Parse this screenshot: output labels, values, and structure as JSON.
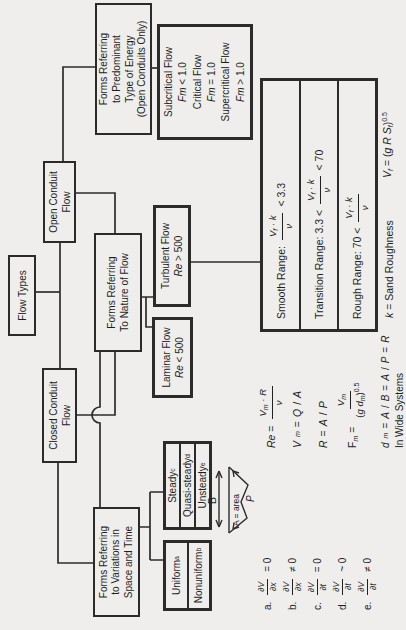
{
  "colors": {
    "background": "#efeeec",
    "ink": "#222222",
    "line": "#2c2c2c"
  },
  "boxes": {
    "flow_types": {
      "label": "Flow Types"
    },
    "closed": {
      "lines": [
        "Closed Conduit",
        "Flow"
      ]
    },
    "open": {
      "lines": [
        "Open Conduit",
        "Flow"
      ]
    },
    "forms_pred": {
      "lines": [
        "Forms Referring",
        "to Predominant",
        "Type of Energy",
        "(Open Conduits Only)"
      ]
    },
    "forms_nature": {
      "lines": [
        "Forms Referring",
        "To Nature of Flow"
      ]
    },
    "forms_var": {
      "lines": [
        "Forms Referring",
        "to Variations in",
        "Space and Time"
      ]
    },
    "subcritical": {
      "lines": [
        [
          {
            "t": "Subcritical Flow"
          }
        ],
        [
          {
            "i": "Fm"
          },
          {
            "t": " < 1.0"
          }
        ],
        [
          {
            "t": "Critical Flow"
          }
        ],
        [
          {
            "i": "Fm"
          },
          {
            "t": " = 1.0"
          }
        ],
        [
          {
            "t": "Supercritical Flow"
          }
        ],
        [
          {
            "i": "Fm"
          },
          {
            "t": " > 1.0"
          }
        ]
      ]
    },
    "laminar": {
      "line1": "Laminar Flow",
      "line2": [
        {
          "i": "Re"
        },
        {
          "t": " < 500"
        }
      ]
    },
    "turbulent": {
      "line1": "Turbulent Flow",
      "line2": [
        {
          "i": "Re"
        },
        {
          "t": " > 500"
        }
      ]
    },
    "steady": {
      "rows": [
        [
          {
            "t": "Steady"
          },
          {
            "u": "c"
          }
        ],
        [
          {
            "t": "Quasi-steady"
          },
          {
            "u": "d"
          }
        ],
        [
          {
            "t": "Unsteady"
          },
          {
            "u": "e"
          }
        ]
      ]
    },
    "uniform": {
      "rows": [
        [
          {
            "t": "Uniform"
          },
          {
            "u": "a"
          }
        ],
        [
          {
            "t": "Nonuniform"
          },
          {
            "u": "b"
          }
        ]
      ]
    },
    "range_table": {
      "rows": [
        {
          "pre": [
            {
              "t": "Smooth Range:"
            }
          ],
          "num": [
            {
              "i": "V"
            },
            {
              "s": "f"
            },
            {
              "t": " · "
            },
            {
              "i": "k"
            }
          ],
          "den": [
            {
              "i": "ν"
            }
          ],
          "post": [
            {
              "t": "< 3.3"
            }
          ]
        },
        {
          "pre": [
            {
              "t": "Transition Range: 3.3 <"
            }
          ],
          "num": [
            {
              "i": "V"
            },
            {
              "s": "f"
            },
            {
              "t": " · "
            },
            {
              "i": "k"
            }
          ],
          "den": [
            {
              "i": "ν"
            }
          ],
          "post": [
            {
              "t": "< 70"
            }
          ]
        },
        {
          "pre": [
            {
              "t": "Rough Range: 70 <"
            }
          ],
          "num": [
            {
              "i": "V"
            },
            {
              "s": "f"
            },
            {
              "t": " · "
            },
            {
              "i": "k"
            }
          ],
          "den": [
            {
              "i": "ν"
            }
          ],
          "post": [
            {
              "t": ""
            }
          ]
        }
      ]
    }
  },
  "formulas": {
    "re": {
      "lhs": [
        {
          "i": "Re"
        },
        {
          "t": " ="
        }
      ],
      "num": [
        {
          "i": "V"
        },
        {
          "s": "m"
        },
        {
          "t": " · "
        },
        {
          "i": "R"
        }
      ],
      "den": [
        {
          "i": "ν"
        }
      ]
    },
    "vm": {
      "line": [
        {
          "i": "V"
        },
        {
          "s": "m"
        },
        {
          "t": " = "
        },
        {
          "i": "Q"
        },
        {
          "t": "/"
        },
        {
          "i": "A"
        }
      ]
    },
    "r": {
      "line": [
        {
          "i": "R"
        },
        {
          "t": " = "
        },
        {
          "i": "A"
        },
        {
          "t": "/"
        },
        {
          "i": "P"
        }
      ]
    },
    "fm": {
      "lhs": [
        {
          "t": "F"
        },
        {
          "s": "m"
        },
        {
          "t": " ="
        }
      ],
      "num": [
        {
          "i": "V"
        },
        {
          "s": "m"
        }
      ],
      "den": [
        {
          "t": "("
        },
        {
          "i": "g d"
        },
        {
          "s": "m"
        },
        {
          "t": ")"
        },
        {
          "u": "0.5"
        }
      ]
    },
    "dm": {
      "line": [
        {
          "i": "d"
        },
        {
          "s": "m"
        },
        {
          "t": " = "
        },
        {
          "i": "A"
        },
        {
          "t": "/"
        },
        {
          "i": "B"
        },
        {
          "t": " = "
        },
        {
          "i": "A"
        },
        {
          "t": "/"
        },
        {
          "i": "P"
        },
        {
          "t": " = "
        },
        {
          "i": "R"
        }
      ],
      "note": "In Wide Systems"
    },
    "k_sand": [
      {
        "i": "k"
      },
      {
        "t": " = Sand Roughness"
      }
    ],
    "vf": [
      {
        "i": "V"
      },
      {
        "s": "f"
      },
      {
        "t": " = ("
      },
      {
        "i": "g R S"
      },
      {
        "s": "f"
      },
      {
        "t": ")"
      },
      {
        "u": "0.5"
      }
    ]
  },
  "footnotes": [
    {
      "label": "a.",
      "num": [
        {
          "t": "∂"
        },
        {
          "i": "V"
        }
      ],
      "den": [
        {
          "t": "∂"
        },
        {
          "i": "x"
        }
      ],
      "tail": "= 0"
    },
    {
      "label": "b.",
      "num": [
        {
          "t": "∂"
        },
        {
          "i": "V"
        }
      ],
      "den": [
        {
          "t": "∂"
        },
        {
          "i": "x"
        }
      ],
      "tail": "≠ 0"
    },
    {
      "label": "c.",
      "num": [
        {
          "t": "∂"
        },
        {
          "i": "V"
        }
      ],
      "den": [
        {
          "t": "∂"
        },
        {
          "i": "t"
        }
      ],
      "tail": "= 0"
    },
    {
      "label": "d.",
      "num": [
        {
          "t": "∂"
        },
        {
          "i": "V"
        }
      ],
      "den": [
        {
          "t": "∂"
        },
        {
          "i": "t"
        }
      ],
      "tail": "~ 0"
    },
    {
      "label": "e.",
      "num": [
        {
          "t": "∂"
        },
        {
          "i": "V"
        }
      ],
      "den": [
        {
          "t": "∂"
        },
        {
          "i": "t"
        }
      ],
      "tail": "≠ 0"
    }
  ],
  "sketch": {
    "b_label": "B",
    "area_label": "A = area",
    "p_label": "P"
  }
}
